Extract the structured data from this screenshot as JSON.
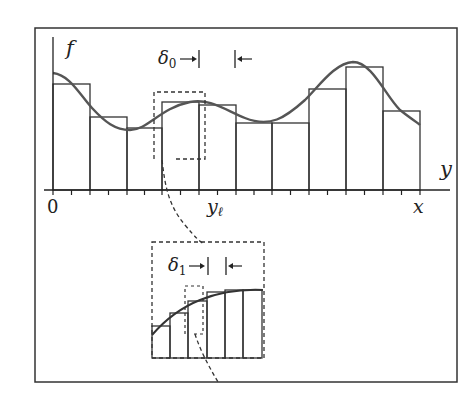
{
  "figure": {
    "type": "riemann-sum-diagram",
    "colors": {
      "frame": "#333333",
      "axis": "#222222",
      "curve": "#555555",
      "bars": "#333333",
      "dashed": "#333333"
    },
    "labels": {
      "y_axis": "f",
      "x_axis_right": "y",
      "origin": "0",
      "y_ell": "y",
      "y_ell_sub": "ℓ",
      "x_end": "x",
      "delta0": "δ",
      "delta0_sub": "0",
      "delta1": "δ",
      "delta1_sub": "1",
      "arrow_right": "→",
      "arrow_left": "←"
    },
    "main_panel": {
      "bar_edges": [
        53,
        90,
        127,
        162,
        199,
        236,
        272,
        309,
        346,
        383,
        420
      ],
      "bar_tops": [
        84,
        117,
        128,
        102,
        105,
        123,
        123,
        89,
        67,
        111
      ],
      "baseline_y": 190,
      "tick_count": 19
    },
    "inset_panel": {
      "bar_edges": [
        152,
        170,
        188,
        207,
        225,
        243,
        262
      ],
      "bar_tops": [
        326,
        313,
        301,
        292,
        290,
        290
      ],
      "baseline_y": 358
    }
  }
}
